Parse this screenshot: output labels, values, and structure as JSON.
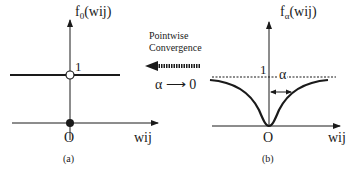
{
  "panel_a": {
    "function_label": "f",
    "function_subscript": "0",
    "function_arg": "(wij)",
    "y_tick": "1",
    "origin": "O",
    "x_label": "wij",
    "caption": "(a)"
  },
  "panel_b": {
    "function_label": "f",
    "function_subscript": "α",
    "function_arg": "(wij)",
    "y_tick": "1",
    "alpha_label": "α",
    "origin": "O",
    "x_label": "wij",
    "caption": "(b)"
  },
  "middle": {
    "line1": "Pointwise",
    "line2": "Convergence",
    "limit": "α ⟶ 0"
  },
  "colors": {
    "ink": "#1a1a1a",
    "background": "#ffffff"
  }
}
